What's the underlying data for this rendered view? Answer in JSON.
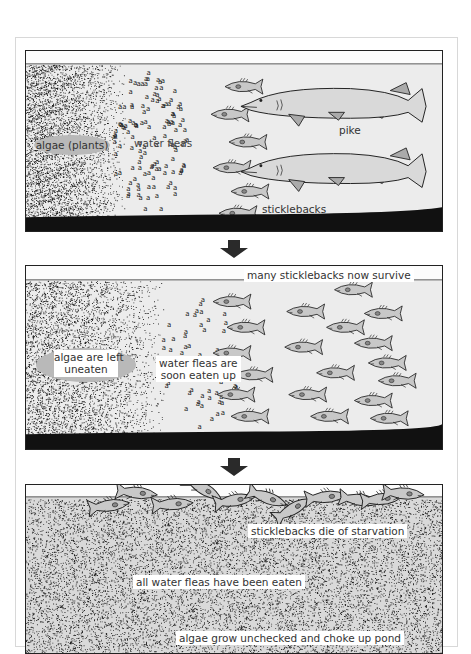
{
  "diagram": {
    "colors": {
      "water": "#ececec",
      "fish_fill": "#c8c8c8",
      "outline": "#222222",
      "algae_dots": "#1a1a1a",
      "label_oval": "#b9b9b9",
      "arrow": "#2a2a2a"
    },
    "panels": [
      {
        "id": "panel-1",
        "stage": "balanced pond with pike",
        "labels": {
          "algae": "algae (plants)",
          "water_fleas": "water fleas",
          "pike": "pike",
          "sticklebacks": "sticklebacks"
        },
        "counts": {
          "pike": 2,
          "sticklebacks": 6
        }
      },
      {
        "id": "panel-2",
        "stage": "pike removed",
        "labels": {
          "sticklebacks": "many sticklebacks now survive",
          "algae_line1": "algae are left",
          "algae_line2": "uneaten",
          "fleas_line1": "water fleas are",
          "fleas_line2": "soon eaten up"
        },
        "counts": {
          "sticklebacks": 19
        }
      },
      {
        "id": "panel-3",
        "stage": "collapse",
        "labels": {
          "sticklebacks": "sticklebacks die of starvation",
          "fleas": "all water fleas have been eaten",
          "algae": "algae grow unchecked and choke up pond"
        },
        "counts": {
          "dead_sticklebacks": 11
        }
      }
    ],
    "arrows": [
      {
        "from": "panel-1",
        "to": "panel-2",
        "icon": "down-arrow-icon"
      },
      {
        "from": "panel-2",
        "to": "panel-3",
        "icon": "down-arrow-icon"
      }
    ]
  }
}
